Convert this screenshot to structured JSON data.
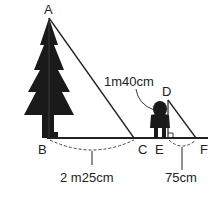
{
  "diagram": {
    "points": {
      "A": "A",
      "B": "B",
      "C": "C",
      "D": "D",
      "E": "E",
      "F": "F"
    },
    "measurements": {
      "person_height": "1m40cm",
      "BC": "2 m25cm",
      "EF": "75cm"
    },
    "colors": {
      "line": "#222222",
      "silhouette": "#1a1a1a"
    }
  }
}
